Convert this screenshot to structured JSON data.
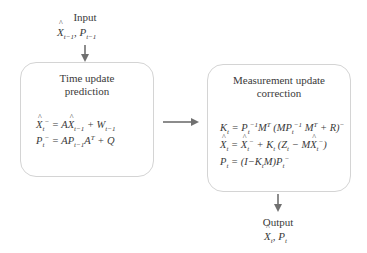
{
  "input": {
    "label": "Input",
    "vars": "X̂t−1, Pt−1"
  },
  "time_update": {
    "title_line1": "Time update",
    "title_line2": "prediction",
    "equations": [
      "X̂t⁻ = AX̂t−1 + Wt−1",
      "Pt⁻ = APt−1Aᵀ + Q"
    ]
  },
  "measurement_update": {
    "title_line1": "Measurement update",
    "title_line2": "correction",
    "equations": [
      "Kt = Pt⁻¹Mᵀ (MPt⁻¹ Mᵀ + R)⁻",
      "X̂t = X̂t⁻ + Kt (Zt − MX̂t⁻)",
      "Pt = (I−KtM)Pt⁻"
    ]
  },
  "output": {
    "label": "Output",
    "vars": "X̂t, Pt"
  },
  "colors": {
    "arrow": "#707070",
    "box_border": "#d4d4d4",
    "text": "#3a3a3a"
  }
}
